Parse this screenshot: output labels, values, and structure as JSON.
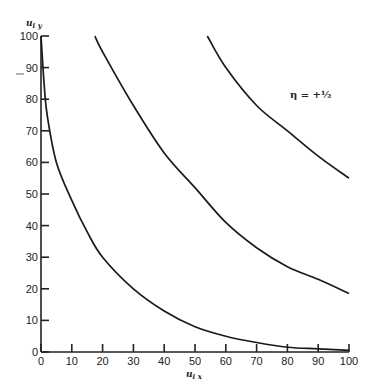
{
  "chart_data": {
    "type": "line",
    "title": "",
    "xlabel": "u_ix",
    "ylabel": "u_iy",
    "xlim": [
      0,
      100
    ],
    "ylim": [
      0,
      100
    ],
    "grid": false,
    "x_ticks": [
      0,
      10,
      20,
      30,
      40,
      50,
      60,
      70,
      80,
      90,
      100
    ],
    "y_ticks": [
      0,
      10,
      20,
      30,
      40,
      50,
      60,
      70,
      80,
      90,
      100
    ],
    "annotations": [
      {
        "text": "η = +½",
        "x": 85,
        "y": 88
      }
    ],
    "series": [
      {
        "name": "curve-1",
        "x": [
          0,
          1,
          2,
          5,
          10,
          15,
          20,
          30,
          40,
          50,
          60,
          70,
          80,
          90,
          100
        ],
        "y": [
          100,
          85,
          75,
          60,
          48,
          38,
          30,
          20,
          13,
          8,
          5,
          3,
          1.5,
          1,
          0.5
        ]
      },
      {
        "name": "curve-2",
        "x": [
          17.5,
          20,
          30,
          40,
          50,
          60,
          70,
          80,
          90,
          100
        ],
        "y": [
          100,
          95,
          78,
          63,
          52,
          41,
          33,
          27,
          23,
          18.5
        ]
      },
      {
        "name": "curve-3",
        "x": [
          54,
          60,
          70,
          80,
          90,
          100
        ],
        "y": [
          100,
          90,
          78,
          70,
          62,
          55
        ]
      }
    ]
  },
  "labels": {
    "xlabel": "u",
    "xlabel_sub": "i x",
    "ylabel": "u",
    "ylabel_sub": "i y",
    "annotation": "η  =  +½"
  }
}
